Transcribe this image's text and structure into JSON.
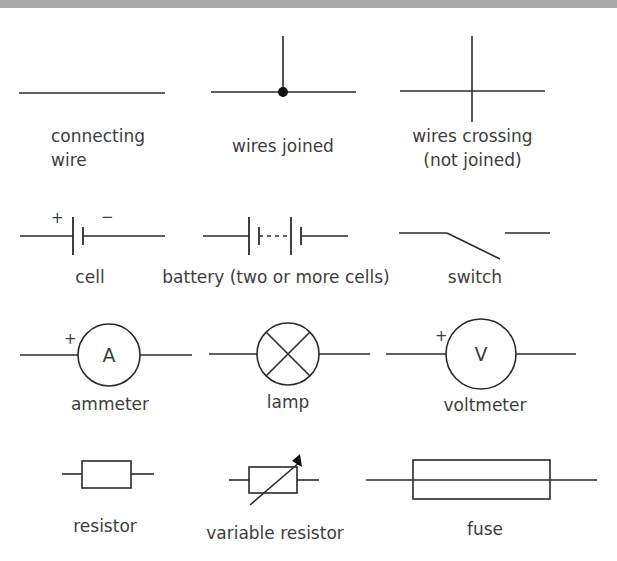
{
  "diagram": {
    "header_bar_color": "#a9a9a9",
    "line_color": "#2a2a2a",
    "text_color": "#3d3d3d",
    "symbols": [
      {
        "id": "connecting-wire",
        "label_line1": "connecting",
        "label_line2": "wire"
      },
      {
        "id": "wires-joined",
        "label": "wires joined"
      },
      {
        "id": "wires-crossing",
        "label_line1": "wires crossing",
        "label_line2": "(not joined)"
      },
      {
        "id": "cell",
        "label": "cell",
        "plus": "+",
        "minus": "−"
      },
      {
        "id": "battery",
        "label": "battery (two or more cells)"
      },
      {
        "id": "switch",
        "label": "switch"
      },
      {
        "id": "ammeter",
        "label": "ammeter",
        "glyph": "A",
        "plus": "+"
      },
      {
        "id": "lamp",
        "label": "lamp"
      },
      {
        "id": "voltmeter",
        "label": "voltmeter",
        "glyph": "V",
        "plus": "+"
      },
      {
        "id": "resistor",
        "label": "resistor"
      },
      {
        "id": "variable-resistor",
        "label": "variable resistor"
      },
      {
        "id": "fuse",
        "label": "fuse"
      }
    ]
  }
}
